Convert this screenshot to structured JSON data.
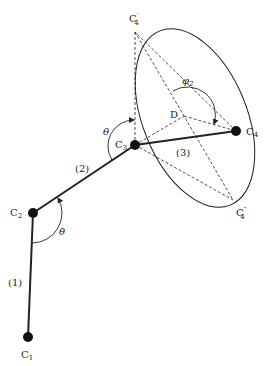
{
  "diagram": {
    "type": "kinematic-chain-cone",
    "nodes": [
      {
        "id": "C1",
        "label": "C",
        "sub": "1"
      },
      {
        "id": "C2",
        "label": "C",
        "sub": "2"
      },
      {
        "id": "C3",
        "label": "C",
        "sub": "3"
      },
      {
        "id": "C4",
        "label": "C",
        "sub": "4"
      },
      {
        "id": "C4p",
        "label": "C",
        "sub": "4",
        "prime": "′"
      },
      {
        "id": "C4pp",
        "label": "C",
        "sub": "4",
        "prime": "″"
      },
      {
        "id": "D",
        "label": "D"
      }
    ],
    "links": [
      {
        "from": "C1",
        "to": "C2",
        "label": "(1)"
      },
      {
        "from": "C2",
        "to": "C3",
        "label": "(2)"
      },
      {
        "from": "C3",
        "to": "C4",
        "label": "(3)"
      }
    ],
    "angles": {
      "theta_c2": "θ",
      "theta_c3": "θ",
      "phi2_symbol": "φ",
      "phi2_sub": "2"
    },
    "colors": {
      "stroke": "#222222",
      "node_fill": "#111111",
      "background": "#ffffff"
    }
  }
}
